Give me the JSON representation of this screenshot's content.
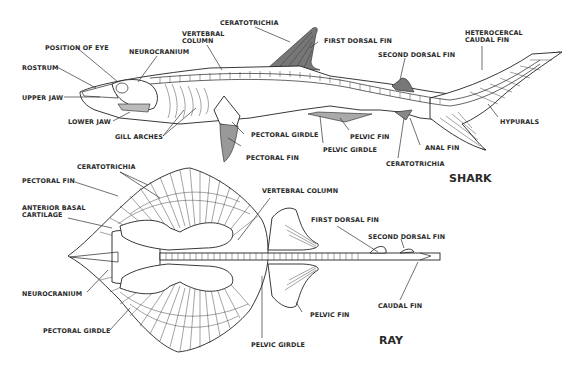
{
  "figure": {
    "shark": {
      "title": "SHARK",
      "labels": {
        "ceratotrichia_dorsal": "CERATOTRICHIA",
        "vertebral_column": "VERTEBRAL",
        "vertebral_column_2": "COLUMN",
        "first_dorsal_fin": "FIRST DORSAL FIN",
        "second_dorsal_fin": "SECOND DORSAL FIN",
        "heterocercal_caudal_fin": "HETEROCERCAL",
        "heterocercal_caudal_fin_2": "CAUDAL FIN",
        "position_of_eye": "POSITION OF EYE",
        "neurocranium": "NEUROCRANIUM",
        "rostrum": "ROSTRUM",
        "upper_jaw": "UPPER JAW",
        "lower_jaw": "LOWER JAW",
        "gill_arches": "GILL ARCHES",
        "pectoral_girdle": "PECTORAL GIRDLE",
        "pectoral_fin": "PECTORAL FIN",
        "pelvic_fin": "PELVIC FIN",
        "pelvic_girdle": "PELVIC GIRDLE",
        "anal_fin": "ANAL FIN",
        "ceratotrichia_anal": "CERATOTRICHIA",
        "hypurals": "HYPURALS"
      }
    },
    "ray": {
      "title": "RAY",
      "labels": {
        "ceratotrichia": "CERATOTRICHIA",
        "pectoral_fin": "PECTORAL FIN",
        "anterior_basal_cartilage": "ANTERIOR BASAL",
        "anterior_basal_cartilage_2": "CARTILAGE",
        "vertebral_column": "VERTEBRAL COLUMN",
        "first_dorsal_fin": "FIRST DORSAL FIN",
        "second_dorsal_fin": "SECOND  DORSAL FIN",
        "neurocranium": "NEUROCRANIUM",
        "caudal_fin": "CAUDAL FIN",
        "pelvic_fin": "PELVIC FIN",
        "pectoral_girdle": "PECTORAL GIRDLE",
        "pelvic_girdle": "PELVIC GIRDLE"
      }
    }
  }
}
